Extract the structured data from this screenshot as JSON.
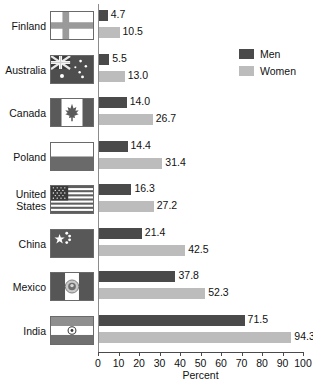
{
  "chart_data": {
    "type": "bar",
    "orientation": "horizontal",
    "title": "",
    "xlabel": "Percent",
    "ylabel": "",
    "xlim": [
      0,
      100
    ],
    "xticks": [
      0,
      10,
      20,
      30,
      40,
      50,
      60,
      70,
      80,
      90,
      100
    ],
    "grid": false,
    "legend_position": "top-right",
    "categories": [
      "Finland",
      "Australia",
      "Canada",
      "Poland",
      "United States",
      "China",
      "Mexico",
      "India"
    ],
    "series": [
      {
        "name": "Men",
        "color": "#4a4a4a",
        "values": [
          4.7,
          5.5,
          14.0,
          14.4,
          16.3,
          21.4,
          37.8,
          71.5
        ]
      },
      {
        "name": "Women",
        "color": "#bcbcbc",
        "values": [
          10.5,
          13.0,
          26.7,
          31.4,
          27.2,
          42.5,
          52.3,
          94.3
        ]
      }
    ]
  },
  "rows": [
    {
      "label": "Finland",
      "label_lines": [
        "Finland"
      ],
      "flag": "flag-finland",
      "men": "4.7",
      "women": "10.5"
    },
    {
      "label": "Australia",
      "label_lines": [
        "Australia"
      ],
      "flag": "flag-australia",
      "men": "5.5",
      "women": "13.0"
    },
    {
      "label": "Canada",
      "label_lines": [
        "Canada"
      ],
      "flag": "flag-canada",
      "men": "14.0",
      "women": "26.7"
    },
    {
      "label": "Poland",
      "label_lines": [
        "Poland"
      ],
      "flag": "flag-poland",
      "men": "14.4",
      "women": "31.4"
    },
    {
      "label": "United States",
      "label_lines": [
        "United",
        "States"
      ],
      "flag": "flag-united-states",
      "men": "16.3",
      "women": "27.2"
    },
    {
      "label": "China",
      "label_lines": [
        "China"
      ],
      "flag": "flag-china",
      "men": "21.4",
      "women": "42.5"
    },
    {
      "label": "Mexico",
      "label_lines": [
        "Mexico"
      ],
      "flag": "flag-mexico",
      "men": "37.8",
      "women": "52.3"
    },
    {
      "label": "India",
      "label_lines": [
        "India"
      ],
      "flag": "flag-india",
      "men": "71.5",
      "women": "94.3"
    }
  ],
  "legend": {
    "items": [
      {
        "label": "Men",
        "color": "#4a4a4a"
      },
      {
        "label": "Women",
        "color": "#bcbcbc"
      }
    ]
  },
  "axis": {
    "xlabel": "Percent",
    "ticks": [
      "0",
      "10",
      "20",
      "30",
      "40",
      "50",
      "60",
      "70",
      "80",
      "90",
      "100"
    ]
  }
}
